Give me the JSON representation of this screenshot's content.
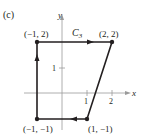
{
  "figure": {
    "panel_label": "(c)",
    "curve_label": "C",
    "curve_subscript": "3",
    "axes": {
      "x_label": "x",
      "y_label": "y",
      "x_ticks": [
        "1",
        "2"
      ],
      "y_ticks": [
        "1"
      ]
    },
    "points": [
      {
        "label": "(−1, 2)",
        "x": -1,
        "y": 2
      },
      {
        "label": "(2, 2)",
        "x": 2,
        "y": 2
      },
      {
        "label": "(1, −1)",
        "x": 1,
        "y": -1
      },
      {
        "label": "(−1, −1)",
        "x": -1,
        "y": -1
      }
    ],
    "path_order": [
      "(−1, −1)",
      "(−1, 2)",
      "(2, 2)",
      "(1, −1)",
      "(−1, −1)"
    ],
    "colors": {
      "ink": "#231f20",
      "axis": "#9a9a9a"
    }
  }
}
